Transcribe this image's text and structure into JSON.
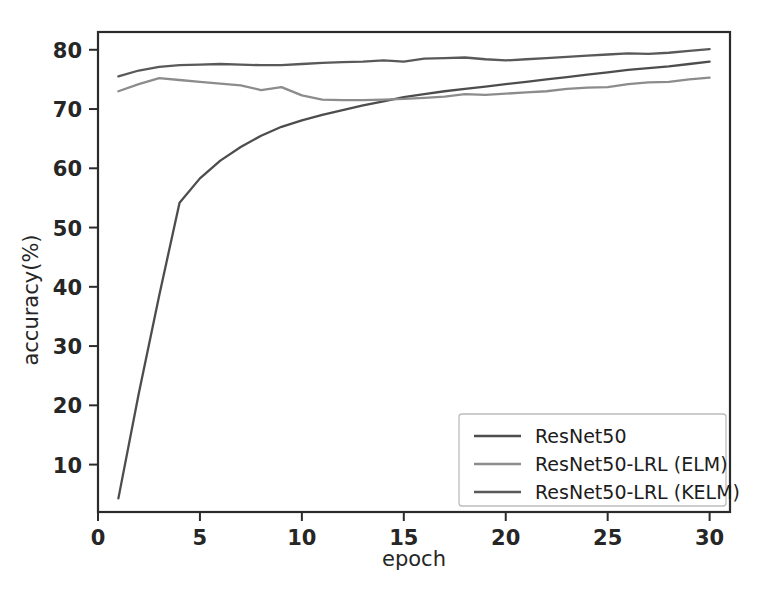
{
  "figure": {
    "background_color": "#ffffff",
    "axes_color": "#2b2b2b"
  },
  "chart_data": {
    "type": "line",
    "title": "",
    "xlabel": "epoch",
    "ylabel": "accuracy(%)",
    "xlim": [
      0,
      31
    ],
    "ylim": [
      2,
      83
    ],
    "xticks": [
      0,
      5,
      10,
      15,
      20,
      25,
      30
    ],
    "xtick_labels": [
      "0",
      "5",
      "10",
      "15",
      "20",
      "25",
      "30"
    ],
    "yticks": [
      10,
      20,
      30,
      40,
      50,
      60,
      70,
      80
    ],
    "ytick_labels": [
      "10",
      "20",
      "30",
      "40",
      "50",
      "60",
      "70",
      "80"
    ],
    "grid": false,
    "legend_position": "lower right",
    "x": [
      1,
      2,
      3,
      4,
      5,
      6,
      7,
      8,
      9,
      10,
      11,
      12,
      13,
      14,
      15,
      16,
      17,
      18,
      19,
      20,
      21,
      22,
      23,
      24,
      25,
      26,
      27,
      28,
      29,
      30
    ],
    "series": [
      {
        "name": "ResNet50",
        "color": "#4d4d4d",
        "values": [
          4.3,
          22.0,
          38.5,
          54.2,
          58.3,
          61.3,
          63.6,
          65.5,
          67.0,
          68.1,
          69.0,
          69.8,
          70.6,
          71.3,
          72.0,
          72.5,
          73.0,
          73.4,
          73.8,
          74.2,
          74.6,
          75.0,
          75.4,
          75.8,
          76.2,
          76.6,
          76.9,
          77.2,
          77.6,
          78.0
        ]
      },
      {
        "name": "ResNet50-LRL (ELM)",
        "color": "#8c8c8c",
        "values": [
          73.0,
          74.2,
          75.2,
          74.9,
          74.6,
          74.3,
          74.0,
          73.2,
          73.7,
          72.3,
          71.6,
          71.5,
          71.5,
          71.6,
          71.7,
          71.9,
          72.1,
          72.5,
          72.4,
          72.6,
          72.8,
          73.0,
          73.4,
          73.6,
          73.7,
          74.2,
          74.5,
          74.6,
          75.0,
          75.3
        ]
      },
      {
        "name": "ResNet50-LRL (KELM)",
        "color": "#595959",
        "values": [
          75.5,
          76.5,
          77.1,
          77.4,
          77.5,
          77.6,
          77.5,
          77.4,
          77.4,
          77.6,
          77.8,
          77.9,
          78.0,
          78.2,
          78.0,
          78.5,
          78.6,
          78.7,
          78.4,
          78.2,
          78.4,
          78.6,
          78.8,
          79.0,
          79.2,
          79.4,
          79.3,
          79.5,
          79.8,
          80.1
        ]
      }
    ]
  },
  "legend": {
    "items": [
      {
        "label": "ResNet50",
        "color": "#4d4d4d"
      },
      {
        "label": "ResNet50-LRL (ELM)",
        "color": "#8c8c8c"
      },
      {
        "label": "ResNet50-LRL (KELM)",
        "color": "#595959"
      }
    ]
  }
}
